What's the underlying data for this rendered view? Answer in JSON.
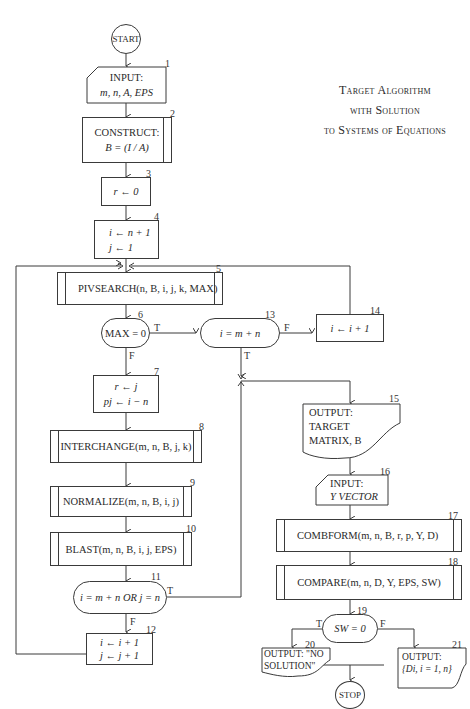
{
  "title": {
    "line1": "Target Algorithm",
    "line2": "with Solution",
    "line3": "to Systems of Equations"
  },
  "nodes": {
    "start": {
      "label": "START"
    },
    "n1": {
      "num": "1",
      "line1": "INPUT:",
      "line2": "m, n, A, EPS"
    },
    "n2": {
      "num": "2",
      "line1": "CONSTRUCT:",
      "line2": "B = (I / A)"
    },
    "n3": {
      "num": "3",
      "label": "r ← 0"
    },
    "n4": {
      "num": "4",
      "line1": "i ← n + 1",
      "line2": "j ← 1"
    },
    "n5": {
      "num": "5",
      "label": "PIVSEARCH(n, B, i, j, k, MAX)"
    },
    "n6": {
      "num": "6",
      "label": "MAX = 0",
      "true": "T",
      "false": "F"
    },
    "n7": {
      "num": "7",
      "line1": "r ← j",
      "line2": "pj ← i − n"
    },
    "n8": {
      "num": "8",
      "label": "INTERCHANGE(m, n, B, j, k)"
    },
    "n9": {
      "num": "9",
      "label": "NORMALIZE(m, n, B, i, j)"
    },
    "n10": {
      "num": "10",
      "label": "BLAST(m, n, B, i, j, EPS)"
    },
    "n11": {
      "num": "11",
      "label": "i = m + n OR j = n",
      "true": "T",
      "false": "F"
    },
    "n12": {
      "num": "12",
      "line1": "i ← i + 1",
      "line2": "j ← j + 1"
    },
    "n13": {
      "num": "13",
      "label": "i = m + n",
      "true": "T",
      "false": "F"
    },
    "n14": {
      "num": "14",
      "label": "i ← i + 1"
    },
    "n15": {
      "num": "15",
      "line1": "OUTPUT:",
      "line2": "TARGET",
      "line3": "MATRIX, B"
    },
    "n16": {
      "num": "16",
      "line1": "INPUT:",
      "line2": "Y VECTOR"
    },
    "n17": {
      "num": "17",
      "label": "COMBFORM(m, n, B, r, p, Y, D)"
    },
    "n18": {
      "num": "18",
      "label": "COMPARE(m, n, D, Y, EPS, SW)"
    },
    "n19": {
      "num": "19",
      "label": "SW = 0",
      "true": "T",
      "false": "F"
    },
    "n20": {
      "num": "20",
      "line1": "OUTPUT: \"NO",
      "line2": "SOLUTION\""
    },
    "n21": {
      "num": "21",
      "line1": "OUTPUT:",
      "line2": "{Di, i = 1, n}"
    },
    "stop": {
      "label": "STOP"
    }
  }
}
